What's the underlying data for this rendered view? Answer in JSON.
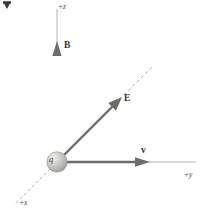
{
  "figure": {
    "background_color": "#ffffff",
    "ink_color": "#57555200",
    "vector_color": "#6b6a67",
    "axis_color": "#a9a7a4",
    "label_color": "#33322f",
    "sphere_color": "#b9b7b3",
    "sphere_highlight": "#efeeec"
  },
  "labels": {
    "magnetic_field": "B",
    "electric_field": "E",
    "velocity": "v",
    "charge": "q",
    "axis_z": "+z",
    "axis_y": "+y",
    "axis_x": "+x"
  },
  "diagram_data": {
    "type": "vector-diagram",
    "origin": {
      "x": 57,
      "y": 162
    },
    "axes": [
      {
        "name": "+z",
        "label": "+z",
        "style": "solid-thin",
        "from": [
          57,
          162
        ],
        "to": [
          57,
          8
        ],
        "label_pos": [
          58,
          3
        ]
      },
      {
        "name": "+y",
        "label": "+y",
        "style": "solid-thin",
        "from": [
          57,
          162
        ],
        "to": [
          196,
          162
        ],
        "label_pos": [
          184,
          171
        ]
      },
      {
        "name": "+x",
        "label": "+x",
        "style": "dashed-thin",
        "from": [
          57,
          162
        ],
        "to": [
          14,
          205
        ],
        "label_pos": [
          19,
          199
        ]
      }
    ],
    "vectors": [
      {
        "name": "B",
        "label": "B",
        "from": [
          57,
          162
        ],
        "to": [
          57,
          46
        ],
        "direction": "+z",
        "style": "solid-thick-arrow",
        "label_pos": [
          64,
          41
        ]
      },
      {
        "name": "E",
        "label": "E",
        "from": [
          57,
          162
        ],
        "to": [
          120,
          99
        ],
        "direction": "diagonal-up-right",
        "style": "solid-thick-arrow",
        "label_pos": [
          124,
          94
        ]
      },
      {
        "name": "v",
        "label": "v",
        "from": [
          57,
          162
        ],
        "to": [
          148,
          162
        ],
        "direction": "+y",
        "style": "solid-thick-arrow",
        "label_pos": [
          141,
          146
        ]
      }
    ],
    "dashed_extensions": [
      {
        "name": "E-extension",
        "from": [
          124,
          95
        ],
        "to": [
          152,
          67
        ],
        "style": "dashed-thin"
      }
    ],
    "charge": {
      "name": "q",
      "label": "q",
      "center": [
        57,
        162
      ],
      "radius": 10,
      "shading": "radial-highlight-upper-left"
    },
    "corner_marker": {
      "name": "crop-marker",
      "shape": "triangle",
      "pos": [
        2,
        1
      ]
    }
  }
}
